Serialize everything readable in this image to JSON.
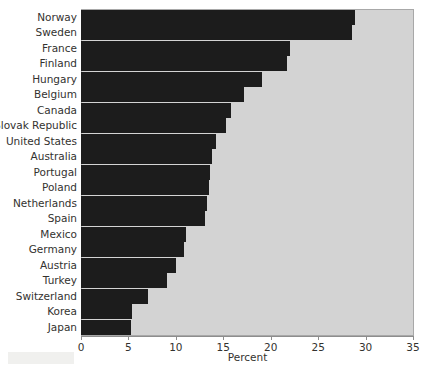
{
  "chart_data": {
    "type": "bar",
    "orientation": "horizontal",
    "title": "",
    "xlabel": "Percent",
    "ylabel": "",
    "xlim": [
      0,
      35
    ],
    "xticks": [
      0,
      5,
      10,
      15,
      20,
      25,
      30,
      35
    ],
    "grid": false,
    "legend": null,
    "bar_color": "#1c1c1c",
    "plot_background": "#d3d3d3",
    "categories": [
      "Norway",
      "Sweden",
      "France",
      "Finland",
      "Hungary",
      "Belgium",
      "Canada",
      "Slovak Republic",
      "United States",
      "Australia",
      "Portugal",
      "Poland",
      "Netherlands",
      "Spain",
      "Mexico",
      "Germany",
      "Austria",
      "Turkey",
      "Switzerland",
      "Korea",
      "Japan"
    ],
    "values": [
      28.9,
      28.6,
      22.0,
      21.7,
      19.1,
      17.2,
      15.8,
      15.3,
      14.2,
      13.8,
      13.6,
      13.5,
      13.3,
      13.1,
      11.1,
      10.9,
      10.0,
      9.1,
      7.1,
      5.4,
      5.3
    ]
  },
  "axis": {
    "x_title": "Percent",
    "tick_labels": [
      "0",
      "5",
      "10",
      "15",
      "20",
      "25",
      "30",
      "35"
    ]
  },
  "title_remnant": ""
}
